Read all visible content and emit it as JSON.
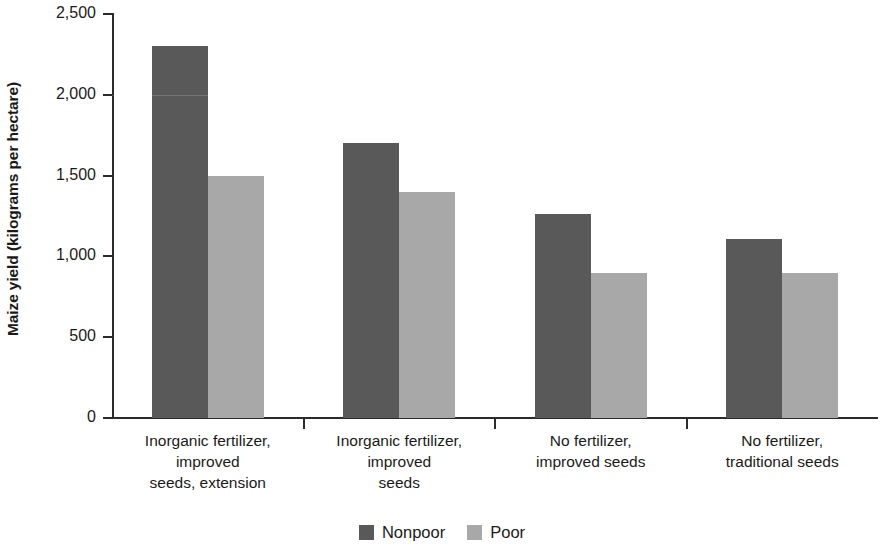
{
  "chart_data": {
    "type": "bar",
    "title": "",
    "subtitle": "",
    "xlabel": "",
    "ylabel": "Maize yield (kilograms per hectare)",
    "ylim": [
      0,
      2500
    ],
    "yticks": [
      0,
      500,
      1000,
      1500,
      2000,
      2500
    ],
    "ytick_labels": [
      "0",
      "500",
      "1,000",
      "1,500",
      "2,000",
      "2,500"
    ],
    "grid": false,
    "legend_position": "bottom-center",
    "categories": [
      "Inorganic fertilizer,\nimproved\nseeds, extension",
      "Inorganic fertilizer,\nimproved\nseeds",
      "No fertilizer,\nimproved seeds",
      "No fertilizer,\ntraditional seeds"
    ],
    "category_lines": [
      [
        "Inorganic fertilizer,",
        "improved",
        "seeds, extension"
      ],
      [
        "Inorganic fertilizer,",
        "improved",
        "seeds"
      ],
      [
        "No fertilizer,",
        "improved seeds"
      ],
      [
        "No fertilizer,",
        "traditional seeds"
      ]
    ],
    "series": [
      {
        "name": "Nonpoor",
        "color": "#595959",
        "values": [
          2300,
          1700,
          1260,
          1110
        ]
      },
      {
        "name": "Poor",
        "color": "#a8a8a8",
        "values": [
          1500,
          1400,
          900,
          900
        ]
      }
    ]
  },
  "legend": {
    "items": [
      {
        "label": "Nonpoor",
        "color": "#595959"
      },
      {
        "label": "Poor",
        "color": "#a8a8a8"
      }
    ]
  },
  "axis": {
    "y_title": "Maize yield (kilograms per hectare)"
  }
}
